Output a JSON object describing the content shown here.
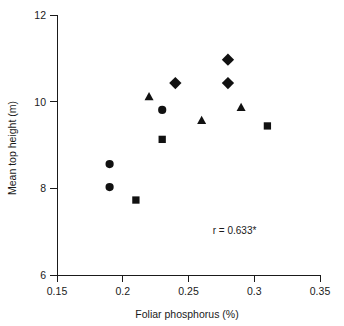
{
  "chart_data": {
    "type": "scatter",
    "title": "",
    "xlabel": "Foliar phosphorus (%)",
    "ylabel": "Mean top height (m)",
    "xlim": [
      0.15,
      0.35
    ],
    "ylim": [
      6,
      12
    ],
    "xticks": [
      "0.15",
      "0.2",
      "0.25",
      "0.3",
      "0.35"
    ],
    "xtick_values": [
      0.15,
      0.2,
      0.25,
      0.3,
      0.35
    ],
    "yticks": [
      "6",
      "8",
      "10",
      "12"
    ],
    "ytick_values": [
      6,
      8,
      10,
      12
    ],
    "grid": false,
    "legend": "none",
    "annotations": [
      {
        "text": "r = 0.633*",
        "x": 0.285,
        "y": 6.95
      }
    ],
    "series": [
      {
        "name": "circle",
        "marker": "circle",
        "color": "#111111",
        "points": [
          {
            "x": 0.19,
            "y": 8.56
          },
          {
            "x": 0.19,
            "y": 8.03
          },
          {
            "x": 0.23,
            "y": 9.81
          }
        ]
      },
      {
        "name": "square",
        "marker": "square",
        "color": "#111111",
        "points": [
          {
            "x": 0.21,
            "y": 7.73
          },
          {
            "x": 0.23,
            "y": 9.13
          },
          {
            "x": 0.31,
            "y": 9.44
          }
        ]
      },
      {
        "name": "triangle",
        "marker": "triangle",
        "color": "#111111",
        "points": [
          {
            "x": 0.22,
            "y": 10.13
          },
          {
            "x": 0.26,
            "y": 9.58
          },
          {
            "x": 0.29,
            "y": 9.88
          }
        ]
      },
      {
        "name": "diamond",
        "marker": "diamond",
        "color": "#111111",
        "points": [
          {
            "x": 0.24,
            "y": 10.43
          },
          {
            "x": 0.28,
            "y": 10.97
          },
          {
            "x": 0.28,
            "y": 10.43
          }
        ]
      }
    ]
  }
}
